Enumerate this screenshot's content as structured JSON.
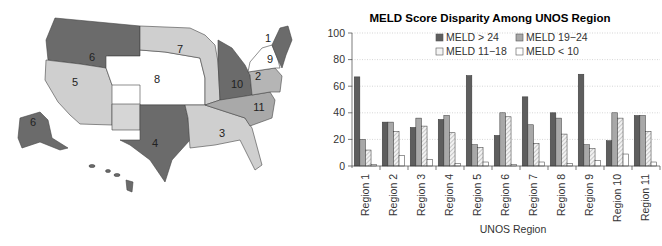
{
  "map": {
    "region_labels": [
      {
        "id": "1",
        "x": 268,
        "y": 42
      },
      {
        "id": "2",
        "x": 258,
        "y": 80
      },
      {
        "id": "3",
        "x": 222,
        "y": 137
      },
      {
        "id": "4",
        "x": 155,
        "y": 147
      },
      {
        "id": "5",
        "x": 75,
        "y": 86
      },
      {
        "id": "6",
        "x": 92,
        "y": 61
      },
      {
        "id": "6b",
        "text": "6",
        "x": 33,
        "y": 126
      },
      {
        "id": "7",
        "x": 180,
        "y": 53
      },
      {
        "id": "8",
        "x": 157,
        "y": 83
      },
      {
        "id": "9",
        "x": 270,
        "y": 63
      },
      {
        "id": "10",
        "x": 237,
        "y": 88
      },
      {
        "id": "11",
        "x": 259,
        "y": 111
      }
    ],
    "colors": {
      "dark": "#6b6b6b",
      "mid": "#a9a9a9",
      "light": "#cfcfcf",
      "white": "#ffffff",
      "border": "#444444"
    }
  },
  "chart_data": {
    "type": "bar",
    "title": "MELD Score Disparity Among UNOS Region",
    "xlabel": "UNOS Region",
    "ylabel": "",
    "ylim": [
      0,
      100
    ],
    "yticks": [
      0,
      20,
      40,
      60,
      80,
      100
    ],
    "grid": "horizontal dotted",
    "legend_position": "top inside",
    "categories": [
      "Region 1",
      "Region 2",
      "Region 3",
      "Region 4",
      "Region 5",
      "Region 6",
      "Region 7",
      "Region 8",
      "Region 9",
      "Region 10",
      "Region 11"
    ],
    "series": [
      {
        "name": "MELD > 24",
        "color": "#5e5e5e",
        "pattern": "solid",
        "values": [
          67,
          33,
          29,
          35,
          68,
          23,
          52,
          40,
          69,
          19,
          38
        ]
      },
      {
        "name": "MELD 19-24",
        "color": "#a8a8a8",
        "pattern": "solid",
        "values": [
          20,
          33,
          36,
          38,
          16,
          40,
          31,
          36,
          16,
          40,
          38
        ]
      },
      {
        "name": "MELD 11-18",
        "color": "#e6e6e6",
        "pattern": "hatched",
        "values": [
          12,
          26,
          30,
          25,
          14,
          37,
          17,
          24,
          13,
          36,
          26
        ]
      },
      {
        "name": "MELD < 10",
        "color": "#ffffff",
        "pattern": "open",
        "values": [
          1,
          8,
          5,
          2,
          3,
          1,
          3,
          2,
          4,
          9,
          3
        ]
      }
    ]
  },
  "legend": {
    "items": [
      "MELD  > 24",
      "MELD  19−24",
      "MELD  11−18",
      "MELD < 10"
    ]
  }
}
